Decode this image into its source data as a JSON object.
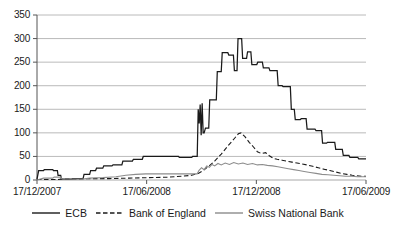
{
  "chart_data": {
    "type": "line",
    "title": "",
    "subtitle": "",
    "xlabel": "",
    "ylabel": "",
    "ylim": [
      0,
      350
    ],
    "yticks": [
      0,
      50,
      100,
      150,
      200,
      250,
      300,
      350
    ],
    "ytick_labels": [
      "0",
      "50",
      "100",
      "150",
      "200",
      "250",
      "300",
      "350"
    ],
    "xtick_labels": [
      "17/12/2007",
      "17/06/2008",
      "17/12/2008",
      "17/06/2009"
    ],
    "xtick_positions": [
      0,
      0.3333,
      0.6667,
      1.0
    ],
    "xlim": [
      0,
      1
    ],
    "grid": "horizontal",
    "legend_position": "bottom",
    "colors": {
      "ecb": "#1a1a1a",
      "boe": "#1a1a1a",
      "snb": "#8c8c8c",
      "grid": "#a8a8a8",
      "axis": "#555555",
      "background": "#ffffff"
    },
    "series": [
      {
        "name": "ECB",
        "style": "solid",
        "color": "#1a1a1a",
        "points": [
          [
            0.0,
            2
          ],
          [
            0.005,
            20
          ],
          [
            0.02,
            20
          ],
          [
            0.022,
            22
          ],
          [
            0.048,
            22
          ],
          [
            0.05,
            20
          ],
          [
            0.062,
            20
          ],
          [
            0.064,
            10
          ],
          [
            0.072,
            10
          ],
          [
            0.074,
            2
          ],
          [
            0.105,
            2
          ],
          [
            0.108,
            3
          ],
          [
            0.14,
            3
          ],
          [
            0.143,
            12
          ],
          [
            0.16,
            12
          ],
          [
            0.163,
            20
          ],
          [
            0.178,
            20
          ],
          [
            0.181,
            25
          ],
          [
            0.2,
            25
          ],
          [
            0.203,
            30
          ],
          [
            0.228,
            30
          ],
          [
            0.231,
            32
          ],
          [
            0.258,
            32
          ],
          [
            0.261,
            40
          ],
          [
            0.29,
            40
          ],
          [
            0.293,
            44
          ],
          [
            0.32,
            44
          ],
          [
            0.323,
            50
          ],
          [
            0.43,
            50
          ],
          [
            0.433,
            48
          ],
          [
            0.47,
            48
          ],
          [
            0.473,
            50
          ],
          [
            0.487,
            50
          ],
          [
            0.49,
            150
          ],
          [
            0.493,
            120
          ],
          [
            0.496,
            160
          ],
          [
            0.499,
            95
          ],
          [
            0.502,
            163
          ],
          [
            0.505,
            100
          ],
          [
            0.508,
            100
          ],
          [
            0.512,
            110
          ],
          [
            0.522,
            110
          ],
          [
            0.525,
            170
          ],
          [
            0.545,
            170
          ],
          [
            0.548,
            230
          ],
          [
            0.56,
            230
          ],
          [
            0.563,
            270
          ],
          [
            0.58,
            270
          ],
          [
            0.583,
            265
          ],
          [
            0.597,
            265
          ],
          [
            0.6,
            232
          ],
          [
            0.608,
            232
          ],
          [
            0.611,
            300
          ],
          [
            0.622,
            300
          ],
          [
            0.625,
            258
          ],
          [
            0.637,
            258
          ],
          [
            0.64,
            272
          ],
          [
            0.65,
            272
          ],
          [
            0.653,
            245
          ],
          [
            0.668,
            245
          ],
          [
            0.671,
            250
          ],
          [
            0.685,
            250
          ],
          [
            0.688,
            238
          ],
          [
            0.705,
            238
          ],
          [
            0.708,
            232
          ],
          [
            0.73,
            232
          ],
          [
            0.733,
            200
          ],
          [
            0.745,
            200
          ],
          [
            0.748,
            198
          ],
          [
            0.77,
            198
          ],
          [
            0.773,
            150
          ],
          [
            0.782,
            150
          ],
          [
            0.785,
            128
          ],
          [
            0.8,
            128
          ],
          [
            0.803,
            130
          ],
          [
            0.818,
            130
          ],
          [
            0.821,
            108
          ],
          [
            0.845,
            108
          ],
          [
            0.848,
            105
          ],
          [
            0.865,
            105
          ],
          [
            0.868,
            78
          ],
          [
            0.88,
            78
          ],
          [
            0.883,
            80
          ],
          [
            0.905,
            80
          ],
          [
            0.908,
            65
          ],
          [
            0.928,
            65
          ],
          [
            0.931,
            52
          ],
          [
            0.948,
            52
          ],
          [
            0.951,
            48
          ],
          [
            0.975,
            48
          ],
          [
            0.978,
            45
          ],
          [
            1.0,
            45
          ]
        ]
      },
      {
        "name": "Bank of England",
        "style": "dashed",
        "color": "#1a1a1a",
        "points": [
          [
            0.0,
            1
          ],
          [
            0.06,
            1
          ],
          [
            0.08,
            2
          ],
          [
            0.12,
            2
          ],
          [
            0.16,
            3
          ],
          [
            0.22,
            3
          ],
          [
            0.28,
            4
          ],
          [
            0.34,
            5
          ],
          [
            0.4,
            6
          ],
          [
            0.44,
            8
          ],
          [
            0.47,
            10
          ],
          [
            0.49,
            14
          ],
          [
            0.505,
            20
          ],
          [
            0.52,
            28
          ],
          [
            0.54,
            40
          ],
          [
            0.56,
            55
          ],
          [
            0.58,
            72
          ],
          [
            0.6,
            88
          ],
          [
            0.612,
            98
          ],
          [
            0.62,
            100
          ],
          [
            0.632,
            92
          ],
          [
            0.645,
            80
          ],
          [
            0.658,
            70
          ],
          [
            0.67,
            60
          ],
          [
            0.682,
            56
          ],
          [
            0.695,
            58
          ],
          [
            0.705,
            52
          ],
          [
            0.718,
            46
          ],
          [
            0.73,
            44
          ],
          [
            0.745,
            42
          ],
          [
            0.76,
            40
          ],
          [
            0.775,
            38
          ],
          [
            0.79,
            36
          ],
          [
            0.805,
            34
          ],
          [
            0.82,
            32
          ],
          [
            0.838,
            29
          ],
          [
            0.855,
            26
          ],
          [
            0.872,
            23
          ],
          [
            0.89,
            20
          ],
          [
            0.908,
            17
          ],
          [
            0.925,
            14
          ],
          [
            0.942,
            12
          ],
          [
            0.958,
            10
          ],
          [
            0.972,
            9
          ],
          [
            0.986,
            8
          ],
          [
            1.0,
            8
          ]
        ]
      },
      {
        "name": "Swiss National Bank",
        "style": "solid",
        "color": "#8c8c8c",
        "points": [
          [
            0.0,
            0
          ],
          [
            0.02,
            4
          ],
          [
            0.048,
            4
          ],
          [
            0.052,
            6
          ],
          [
            0.072,
            6
          ],
          [
            0.076,
            2
          ],
          [
            0.105,
            2
          ],
          [
            0.14,
            2
          ],
          [
            0.16,
            4
          ],
          [
            0.2,
            5
          ],
          [
            0.24,
            7
          ],
          [
            0.27,
            10
          ],
          [
            0.3,
            12
          ],
          [
            0.33,
            13
          ],
          [
            0.36,
            13
          ],
          [
            0.43,
            13
          ],
          [
            0.47,
            13
          ],
          [
            0.487,
            13
          ],
          [
            0.492,
            20
          ],
          [
            0.5,
            26
          ],
          [
            0.508,
            22
          ],
          [
            0.516,
            30
          ],
          [
            0.524,
            27
          ],
          [
            0.532,
            33
          ],
          [
            0.54,
            30
          ],
          [
            0.55,
            35
          ],
          [
            0.56,
            32
          ],
          [
            0.572,
            36
          ],
          [
            0.585,
            33
          ],
          [
            0.598,
            37
          ],
          [
            0.612,
            34
          ],
          [
            0.626,
            36
          ],
          [
            0.64,
            33
          ],
          [
            0.655,
            35
          ],
          [
            0.67,
            32
          ],
          [
            0.685,
            33
          ],
          [
            0.7,
            31
          ],
          [
            0.716,
            30
          ],
          [
            0.732,
            28
          ],
          [
            0.748,
            26
          ],
          [
            0.764,
            24
          ],
          [
            0.78,
            22
          ],
          [
            0.796,
            20
          ],
          [
            0.812,
            18
          ],
          [
            0.83,
            16
          ],
          [
            0.848,
            14
          ],
          [
            0.866,
            12
          ],
          [
            0.884,
            11
          ],
          [
            0.902,
            10
          ],
          [
            0.92,
            9
          ],
          [
            0.938,
            8
          ],
          [
            0.956,
            8
          ],
          [
            0.974,
            7
          ],
          [
            1.0,
            7
          ]
        ]
      }
    ]
  },
  "legend": {
    "items": [
      {
        "label": "ECB",
        "style": "solid",
        "color": "#1a1a1a"
      },
      {
        "label": "Bank of England",
        "style": "dashed",
        "color": "#1a1a1a"
      },
      {
        "label": "Swiss National Bank",
        "style": "solid",
        "color": "#8c8c8c"
      }
    ]
  }
}
